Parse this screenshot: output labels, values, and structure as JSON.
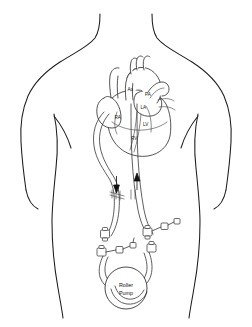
{
  "figure": {
    "view": "anterior-torso-line-drawing",
    "background_color": "#ffffff",
    "line_color": "#1b1b1b"
  },
  "heart_labels": [
    {
      "id": "ao",
      "text": "Ao",
      "name": "aorta",
      "x": 127.5,
      "y": 90.5
    },
    {
      "id": "pa",
      "text": "PA",
      "name": "pulmonary-artery",
      "x": 145.0,
      "y": 96.0
    },
    {
      "id": "la",
      "text": "LA",
      "name": "left-atrium",
      "x": 140.5,
      "y": 108.5
    },
    {
      "id": "ra",
      "text": "RA",
      "name": "right-atrium",
      "x": 114.5,
      "y": 119.0
    },
    {
      "id": "lv",
      "text": "LV",
      "name": "left-ventricle",
      "x": 143.0,
      "y": 125.5
    },
    {
      "id": "rv",
      "text": "RV",
      "name": "right-ventricle",
      "x": 131.0,
      "y": 140.0
    }
  ],
  "pump": {
    "label_line1": "Roller",
    "label_line2": "Pump",
    "cx": 126,
    "cy": 288,
    "r": 21
  },
  "flow_arrows": [
    {
      "id": "venous-drain",
      "direction": "down",
      "x": 116.5,
      "y_top": 176,
      "y_bottom": 192
    },
    {
      "id": "arterial-return",
      "direction": "up",
      "x": 137.0,
      "y_top": 176,
      "y_bottom": 192
    }
  ],
  "connectors": [
    {
      "id": "venous-connector-upper",
      "x": 105,
      "y": 234
    },
    {
      "id": "venous-connector-lower",
      "x": 101,
      "y": 252
    },
    {
      "id": "arterial-connector-upper",
      "x": 146,
      "y": 232
    },
    {
      "id": "arterial-connector-lower",
      "x": 152,
      "y": 248
    }
  ]
}
